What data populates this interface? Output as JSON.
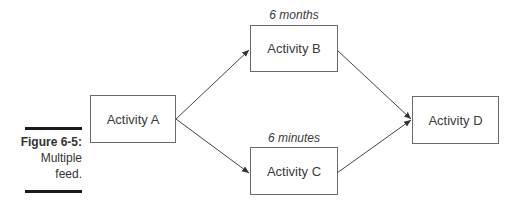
{
  "caption": {
    "figure": "Figure 6-5:",
    "line1": "Multiple",
    "line2": "feed."
  },
  "nodes": {
    "a": {
      "label": "Activity A"
    },
    "b": {
      "label": "Activity B",
      "duration": "6 months"
    },
    "c": {
      "label": "Activity C",
      "duration": "6 minutes"
    },
    "d": {
      "label": "Activity D"
    }
  },
  "edges": [
    {
      "from": "Activity A",
      "to": "Activity B"
    },
    {
      "from": "Activity A",
      "to": "Activity C"
    },
    {
      "from": "Activity B",
      "to": "Activity D"
    },
    {
      "from": "Activity C",
      "to": "Activity D"
    }
  ]
}
